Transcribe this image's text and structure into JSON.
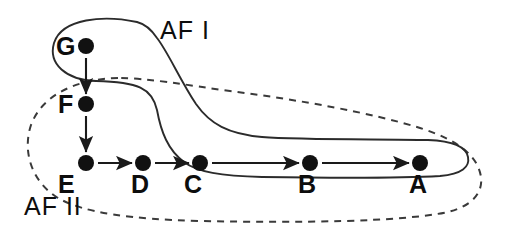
{
  "figure": {
    "type": "diagram",
    "background_color": "#ffffff",
    "ink_color": "#111111",
    "width": 506,
    "height": 236
  },
  "regions": [
    {
      "id": "af1",
      "label": "AF I",
      "outline_style": "solid",
      "label_x": 160,
      "label_y": 39,
      "contains": [
        "G",
        "C",
        "B",
        "A"
      ]
    },
    {
      "id": "af2",
      "label": "AF II",
      "outline_style": "dashed",
      "label_x": 24,
      "label_y": 215,
      "contains": [
        "F",
        "E",
        "D",
        "C",
        "B",
        "A"
      ]
    }
  ],
  "nodes": [
    {
      "id": "G",
      "label": "G",
      "x": 86,
      "y": 46,
      "r": 8,
      "label_x": 56,
      "label_y": 55
    },
    {
      "id": "F",
      "label": "F",
      "x": 86,
      "y": 104,
      "r": 8,
      "label_x": 58,
      "label_y": 113
    },
    {
      "id": "E",
      "label": "E",
      "x": 86,
      "y": 163,
      "r": 8,
      "label_x": 58,
      "label_y": 193
    },
    {
      "id": "D",
      "label": "D",
      "x": 143,
      "y": 163,
      "r": 8,
      "label_x": 131,
      "label_y": 193
    },
    {
      "id": "C",
      "label": "C",
      "x": 200,
      "y": 163,
      "r": 8,
      "label_x": 184,
      "label_y": 193
    },
    {
      "id": "B",
      "label": "B",
      "x": 310,
      "y": 163,
      "r": 8,
      "label_x": 298,
      "label_y": 193
    },
    {
      "id": "A",
      "label": "A",
      "x": 420,
      "y": 163,
      "r": 8,
      "label_x": 409,
      "label_y": 193
    }
  ],
  "edges": [
    {
      "from": "G",
      "to": "F",
      "direction": "down",
      "x1": 86,
      "y1": 58,
      "x2": 86,
      "y2": 94
    },
    {
      "from": "F",
      "to": "E",
      "direction": "down",
      "x1": 86,
      "y1": 116,
      "x2": 86,
      "y2": 152
    },
    {
      "from": "E",
      "to": "D",
      "direction": "right",
      "x1": 98,
      "y1": 163,
      "x2": 132,
      "y2": 163
    },
    {
      "from": "D",
      "to": "C",
      "direction": "right",
      "x1": 155,
      "y1": 163,
      "x2": 189,
      "y2": 163
    },
    {
      "from": "C",
      "to": "B",
      "direction": "right",
      "x1": 212,
      "y1": 163,
      "x2": 299,
      "y2": 163
    },
    {
      "from": "B",
      "to": "A",
      "direction": "right",
      "x1": 322,
      "y1": 163,
      "x2": 409,
      "y2": 163
    }
  ],
  "paths": {
    "af1_outline": "M 137 22 C 104 15, 62 18, 54 43 C 48 64, 66 80, 96 81 C 138 82, 152 88, 157 110 C 161 132, 168 150, 184 162 C 197 172, 221 176, 262 177 C 330 178, 404 178, 440 176 C 462 174, 470 167, 468 157 C 466 146, 452 141, 428 140 C 380 139, 300 140, 262 137 C 228 134, 210 124, 196 104 C 180 80, 168 52, 157 38 C 151 29, 145 24, 137 22 Z",
    "af2_outline": "M 118 78 C 76 79, 42 95, 31 125 C 22 152, 32 182, 58 198 C 84 213, 130 219, 200 221 C 300 223, 400 222, 448 212 C 472 206, 483 193, 481 177 C 478 156, 458 140, 420 128 C 372 113, 300 100, 230 91 C 186 85, 148 78, 118 78 Z"
  }
}
